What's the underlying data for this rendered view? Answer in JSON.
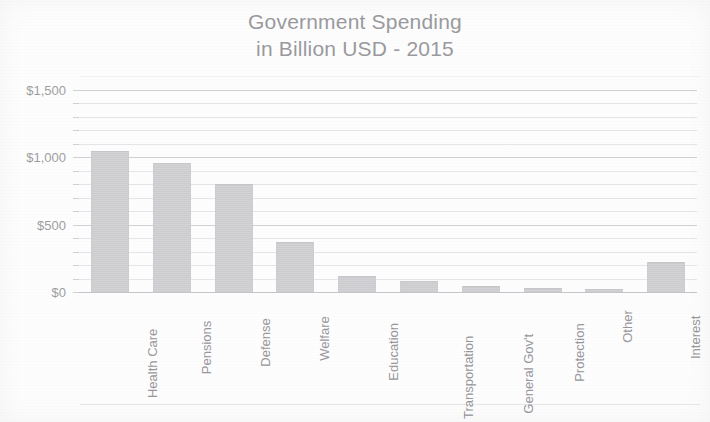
{
  "chart_data": {
    "type": "bar",
    "title": "Government Spending in Billion USD - 2015",
    "title_line1": "Government Spending",
    "title_line2": "in Billion USD - 2015",
    "xlabel": "",
    "ylabel": "",
    "ylim": [
      0,
      1500
    ],
    "ytick_values": [
      0,
      500,
      1000,
      1500
    ],
    "ytick_labels": [
      "$0",
      "$500",
      "$1,000",
      "$1,500"
    ],
    "minor_gridline_step": 100,
    "grid": true,
    "legend": false,
    "categories": [
      "Health Care",
      "Pensions",
      "Defense",
      "Welfare",
      "Education",
      "Transportation",
      "General Gov't",
      "Protection",
      "Other",
      "Interest"
    ],
    "values": [
      1050,
      960,
      800,
      370,
      120,
      80,
      45,
      30,
      20,
      220
    ],
    "bar_color": "#d6d6d9",
    "grid_color": "#e0e1e4",
    "text_color": "#9a9a9e"
  }
}
